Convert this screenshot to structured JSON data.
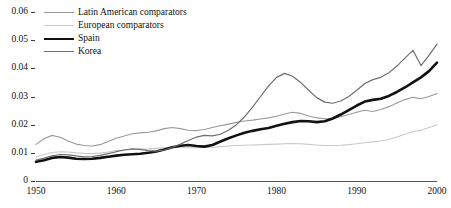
{
  "chart_data": {
    "type": "line",
    "title": "",
    "subtitle": "",
    "xlabel": "",
    "ylabel": "",
    "xlim": [
      1950,
      2000
    ],
    "ylim": [
      0,
      0.06
    ],
    "grid": false,
    "legend_position": "top-left",
    "x_ticks": [
      "1950",
      "1960",
      "1970",
      "1980",
      "1990",
      "2000"
    ],
    "x_tick_values": [
      1950,
      1960,
      1970,
      1980,
      1990,
      2000
    ],
    "y_ticks": [
      "0",
      "0.01",
      "0.02",
      "0.03",
      "0.04",
      "0.05",
      "0.06"
    ],
    "y_tick_values": [
      0,
      0.01,
      0.02,
      0.03,
      0.04,
      0.05,
      0.06
    ],
    "x": [
      1950,
      1951,
      1952,
      1953,
      1954,
      1955,
      1956,
      1957,
      1958,
      1959,
      1960,
      1961,
      1962,
      1963,
      1964,
      1965,
      1966,
      1967,
      1968,
      1969,
      1970,
      1971,
      1972,
      1973,
      1974,
      1975,
      1976,
      1977,
      1978,
      1979,
      1980,
      1981,
      1982,
      1983,
      1984,
      1985,
      1986,
      1987,
      1988,
      1989,
      1990,
      1991,
      1992,
      1993,
      1994,
      1995,
      1996,
      1997,
      1998,
      1999,
      2000
    ],
    "series": [
      {
        "name": "Latin American comparators",
        "color": "#9a9a9a",
        "width": 1.1,
        "values": [
          0.013,
          0.015,
          0.0162,
          0.0155,
          0.0142,
          0.0131,
          0.0126,
          0.0124,
          0.0129,
          0.014,
          0.0152,
          0.016,
          0.0168,
          0.0171,
          0.0173,
          0.0178,
          0.0186,
          0.019,
          0.0186,
          0.018,
          0.0179,
          0.0183,
          0.019,
          0.0196,
          0.0202,
          0.0208,
          0.0213,
          0.0216,
          0.022,
          0.0224,
          0.023,
          0.0238,
          0.0244,
          0.024,
          0.0231,
          0.0224,
          0.0221,
          0.0222,
          0.0228,
          0.0236,
          0.0244,
          0.0251,
          0.0247,
          0.0254,
          0.0264,
          0.0277,
          0.0289,
          0.0297,
          0.0292,
          0.03,
          0.0311
        ]
      },
      {
        "name": "European comparators",
        "color": "#c9c9c9",
        "width": 1.1,
        "values": [
          0.0085,
          0.0094,
          0.0101,
          0.0104,
          0.0103,
          0.01,
          0.0098,
          0.0097,
          0.0099,
          0.0103,
          0.0108,
          0.011,
          0.0112,
          0.0113,
          0.0114,
          0.0116,
          0.0118,
          0.0119,
          0.0119,
          0.0118,
          0.0118,
          0.0119,
          0.012,
          0.0122,
          0.0124,
          0.0126,
          0.0127,
          0.0128,
          0.0129,
          0.013,
          0.0131,
          0.0132,
          0.0133,
          0.0132,
          0.013,
          0.0128,
          0.0126,
          0.0126,
          0.0127,
          0.0129,
          0.0132,
          0.0136,
          0.0139,
          0.0142,
          0.0148,
          0.0156,
          0.0166,
          0.0176,
          0.018,
          0.019,
          0.02
        ]
      },
      {
        "name": "Spain",
        "color": "#111111",
        "width": 2.6,
        "values": [
          0.0068,
          0.0074,
          0.0082,
          0.0085,
          0.0083,
          0.0079,
          0.0078,
          0.0079,
          0.0082,
          0.0086,
          0.009,
          0.0093,
          0.0095,
          0.0097,
          0.01,
          0.0105,
          0.0112,
          0.012,
          0.0125,
          0.0128,
          0.0124,
          0.0122,
          0.0128,
          0.014,
          0.0152,
          0.0162,
          0.0171,
          0.0178,
          0.0184,
          0.0188,
          0.0196,
          0.0203,
          0.0209,
          0.0213,
          0.0212,
          0.0209,
          0.0212,
          0.0222,
          0.0236,
          0.0252,
          0.0268,
          0.0282,
          0.0288,
          0.0292,
          0.0302,
          0.0316,
          0.0332,
          0.035,
          0.0368,
          0.039,
          0.042
        ]
      },
      {
        "name": "Korea",
        "color": "#6e6e6e",
        "width": 1.2,
        "values": [
          0.0074,
          0.0081,
          0.0089,
          0.0094,
          0.0093,
          0.0089,
          0.0086,
          0.0087,
          0.0091,
          0.0097,
          0.0104,
          0.011,
          0.0114,
          0.0112,
          0.0108,
          0.0106,
          0.011,
          0.0119,
          0.0131,
          0.0144,
          0.0156,
          0.0162,
          0.016,
          0.0166,
          0.018,
          0.02,
          0.0228,
          0.0262,
          0.03,
          0.0338,
          0.0368,
          0.0382,
          0.0372,
          0.035,
          0.0322,
          0.0296,
          0.028,
          0.0276,
          0.0284,
          0.03,
          0.0322,
          0.0346,
          0.036,
          0.0368,
          0.0384,
          0.0408,
          0.0436,
          0.0464,
          0.041,
          0.0446,
          0.0486
        ]
      }
    ]
  },
  "legend": {
    "items": [
      {
        "label": "Latin American comparators",
        "color": "#9a9a9a",
        "width": 1.1
      },
      {
        "label": "European comparators",
        "color": "#c9c9c9",
        "width": 1.1
      },
      {
        "label": "Spain",
        "color": "#111111",
        "width": 2.6
      },
      {
        "label": "Korea",
        "color": "#6e6e6e",
        "width": 1.2
      }
    ]
  }
}
